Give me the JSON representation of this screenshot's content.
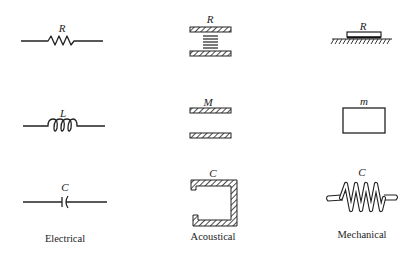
{
  "diagram": {
    "columns": [
      {
        "id": "electrical",
        "label": "Electrical"
      },
      {
        "id": "acoustical",
        "label": "Acoustical"
      },
      {
        "id": "mechanical",
        "label": "Mechanical"
      }
    ],
    "rows": [
      {
        "quantity": "resistance",
        "symbols": {
          "electrical": "R",
          "acoustical": "R",
          "mechanical": "R"
        },
        "elements": {
          "electrical": "resistor",
          "acoustical": "acoustic-resistance-screen",
          "mechanical": "mechanical-friction-damper"
        }
      },
      {
        "quantity": "inertance",
        "symbols": {
          "electrical": "L",
          "acoustical": "M",
          "mechanical": "m"
        },
        "elements": {
          "electrical": "inductor",
          "acoustical": "acoustic-mass-tube",
          "mechanical": "mass-block"
        }
      },
      {
        "quantity": "compliance",
        "symbols": {
          "electrical": "C",
          "acoustical": "C",
          "mechanical": "C"
        },
        "elements": {
          "electrical": "capacitor",
          "acoustical": "acoustic-cavity",
          "mechanical": "spring"
        }
      }
    ],
    "colors": {
      "ink": "#222222",
      "background": "#ffffff"
    }
  }
}
